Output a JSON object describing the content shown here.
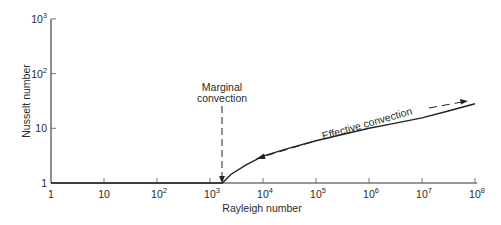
{
  "chart_data": {
    "type": "line",
    "title": "",
    "xlabel": "Rayleigh number",
    "ylabel": "Nusselt number",
    "xscale": "log",
    "yscale": "log",
    "xlim": [
      1,
      100000000
    ],
    "ylim": [
      1,
      1000
    ],
    "grid": false,
    "x_ticks": [
      {
        "value": 1,
        "base": "1",
        "exp": ""
      },
      {
        "value": 10,
        "base": "10",
        "exp": ""
      },
      {
        "value": 100,
        "base": "10",
        "exp": "2"
      },
      {
        "value": 1000,
        "base": "10",
        "exp": "3"
      },
      {
        "value": 10000,
        "base": "10",
        "exp": "4"
      },
      {
        "value": 100000,
        "base": "10",
        "exp": "5"
      },
      {
        "value": 1000000,
        "base": "10",
        "exp": "6"
      },
      {
        "value": 10000000,
        "base": "10",
        "exp": "7"
      },
      {
        "value": 100000000,
        "base": "10",
        "exp": "8"
      }
    ],
    "y_ticks": [
      {
        "value": 1,
        "base": "1",
        "exp": ""
      },
      {
        "value": 10,
        "base": "10",
        "exp": ""
      },
      {
        "value": 100,
        "base": "10",
        "exp": "2"
      },
      {
        "value": 1000,
        "base": "10",
        "exp": "3"
      }
    ],
    "series": [
      {
        "name": "Nusselt number",
        "x": [
          1,
          10,
          100,
          1000,
          1708,
          2500,
          5000,
          10000,
          30000,
          100000,
          300000,
          1000000,
          3000000,
          10000000,
          30000000,
          100000000
        ],
        "y": [
          1.0,
          1.0,
          1.0,
          1.0,
          1.0,
          1.45,
          2.2,
          3.1,
          4.3,
          5.9,
          7.6,
          10.0,
          12.3,
          15.5,
          20.5,
          28.0
        ]
      }
    ],
    "annotations": [
      {
        "text_lines": [
          "Marginal",
          "convection"
        ],
        "x": 1708,
        "type": "dashed-arrow-down"
      },
      {
        "text": "Effective convection",
        "type": "rotated-label",
        "arrows": [
          "left",
          "right"
        ]
      }
    ]
  }
}
